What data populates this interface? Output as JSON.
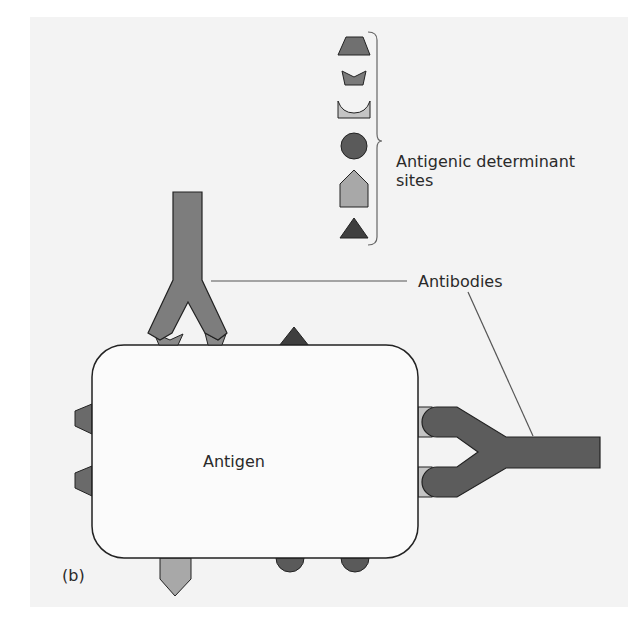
{
  "figure": {
    "panel_label": "(b)",
    "background_color": "#f3f3f3"
  },
  "labels": {
    "antigen": "Antigen",
    "antibodies": "Antibodies",
    "antigenic_determinant_sites": "Antigenic determinant sites"
  },
  "legend": {
    "title": "Antigenic determinant sites",
    "shapes": [
      {
        "name": "trapezoid",
        "color": "#707070"
      },
      {
        "name": "notched-trapezoid",
        "color": "#7a7a7a"
      },
      {
        "name": "cup",
        "color": "#c4c4c4"
      },
      {
        "name": "circle",
        "color": "#5a5a5a"
      },
      {
        "name": "pentagon",
        "color": "#a8a8a8"
      },
      {
        "name": "triangle",
        "color": "#3f3f3f"
      }
    ]
  },
  "elements": {
    "antigen": {
      "shape": "rounded-rectangle",
      "fill": "#fbfbfb",
      "stroke": "#222222"
    },
    "antibody_top": {
      "orientation": "vertical",
      "fill": "#7d7d7d"
    },
    "antibody_right": {
      "orientation": "horizontal",
      "fill": "#5c5c5c"
    }
  }
}
